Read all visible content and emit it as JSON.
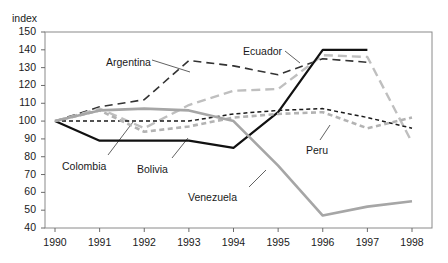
{
  "chart_data": {
    "type": "line",
    "title": "",
    "ylabel": "index",
    "xlabel": "",
    "ylim": [
      40,
      150
    ],
    "xlim": [
      1990,
      1998
    ],
    "grid": false,
    "legend_position": "inline-annotations",
    "x": [
      1990,
      1991,
      1992,
      1993,
      1994,
      1995,
      1996,
      1997,
      1998
    ],
    "ytick_labels": [
      "150",
      "140",
      "130",
      "120",
      "110",
      "100",
      "90",
      "80",
      "70",
      "60",
      "50",
      "40"
    ],
    "xtick_labels": [
      "1990",
      "1991",
      "1992",
      "1993",
      "1994",
      "1995",
      "1996",
      "1997",
      "1998"
    ],
    "series": [
      {
        "name": "Argentina",
        "color": "#333333",
        "style": "long-dash",
        "width": 1.6,
        "values": [
          100,
          108,
          112,
          134,
          131,
          126,
          135,
          133,
          null
        ],
        "label_xy": [
          106,
          56
        ],
        "leader": [
          [
            152,
            60
          ],
          [
            190,
            72
          ]
        ]
      },
      {
        "name": "Ecuador",
        "color": "#bfbfbf",
        "style": "long-dash",
        "width": 2.4,
        "values": [
          100,
          107,
          96,
          109,
          117,
          118,
          137,
          136,
          88
        ],
        "label_xy": [
          243,
          45
        ],
        "leader": [
          [
            285,
            51
          ],
          [
            300,
            63
          ]
        ]
      },
      {
        "name": "Colombia",
        "color": "#111111",
        "style": "solid",
        "width": 2.2,
        "values": [
          100,
          89,
          89,
          89,
          85,
          105,
          140,
          140,
          null
        ],
        "label_xy": [
          62,
          160
        ],
        "leader": [
          [
            108,
            155
          ],
          [
            133,
            122
          ]
        ]
      },
      {
        "name": "Bolivia",
        "color": "#1a1a1a",
        "style": "short-dash",
        "width": 1.5,
        "values": [
          100,
          100,
          100,
          100,
          104,
          106,
          107,
          102,
          96
        ],
        "label_xy": [
          137,
          163
        ],
        "leader": [
          [
            172,
            158
          ],
          [
            188,
            138
          ]
        ]
      },
      {
        "name": "Peru",
        "color": "#b3b3b3",
        "style": "short-dash",
        "width": 2.6,
        "values": [
          100,
          106,
          94,
          97,
          102,
          104,
          105,
          96,
          102
        ],
        "label_xy": [
          306,
          144
        ],
        "leader": [
          [
            320,
            140
          ],
          [
            330,
            125
          ]
        ]
      },
      {
        "name": "Venezuela",
        "color": "#a6a6a6",
        "style": "solid",
        "width": 2.6,
        "values": [
          100,
          106,
          107,
          106,
          100,
          75,
          47,
          52,
          55
        ],
        "label_xy": [
          188,
          191
        ],
        "leader": [
          [
            249,
            187
          ],
          [
            266,
            170
          ]
        ]
      }
    ]
  }
}
